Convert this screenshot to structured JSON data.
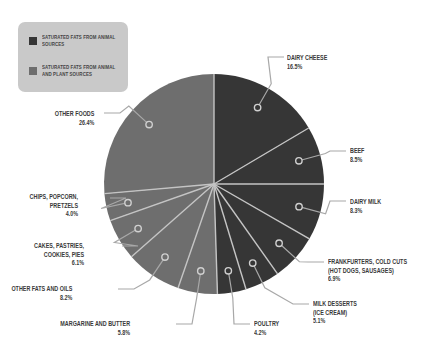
{
  "legend": {
    "items": [
      {
        "label": "SATURATED FATS FROM ANIMAL SOURCES",
        "color": "#363636"
      },
      {
        "label": "SATURATED FATS FROM ANIMAL AND PLANT SOURCES",
        "color": "#6e6e6e"
      }
    ]
  },
  "labels": {
    "dairy_cheese": {
      "name": "DAIRY CHEESE",
      "value": "16.5%"
    },
    "beef": {
      "name": "BEEF",
      "value": "8.5%"
    },
    "dairy_milk": {
      "name": "DAIRY MILK",
      "value": "8.3%"
    },
    "frankfurters_l1": "FRANKFURTERS, COLD CUTS",
    "frankfurters_l2": "(HOT DOGS, SAUSAGES)",
    "frankfurters_value": "6.9%",
    "milk_desserts_l1": "MILK DESSERTS",
    "milk_desserts_l2": "(ICE CREAM)",
    "milk_desserts_value": "5.1%",
    "poultry": {
      "name": "POULTRY",
      "value": "4.2%"
    },
    "margarine": {
      "name": "MARGARINE AND BUTTER",
      "value": "5.8%"
    },
    "other_fats": {
      "name": "OTHER FATS AND OILS",
      "value": "8.2%"
    },
    "cakes_l1": "CAKES, PASTRIES,",
    "cakes_l2": "COOKIES, PIES",
    "cakes_value": "6.1%",
    "chips_l1": "CHIPS, POPCORN,",
    "chips_l2": "PRETZELS",
    "chips_value": "4.0%",
    "other_foods": {
      "name": "OTHER FOODS",
      "value": "26.4%"
    }
  },
  "colors": {
    "animal": "#363636",
    "animal_and_plant": "#6e6e6e",
    "separator": "#c4c4c4",
    "leader": "#a8a8a8",
    "legend_bg": "#c9c9c9"
  },
  "chart_data": {
    "type": "pie",
    "title": "",
    "categories": [
      "Dairy cheese",
      "Beef",
      "Dairy milk",
      "Frankfurters, cold cuts (hot dogs, sausages)",
      "Milk desserts (ice cream)",
      "Poultry",
      "Margarine and butter",
      "Other fats and oils",
      "Cakes, pastries, cookies, pies",
      "Chips, popcorn, pretzels",
      "Other foods"
    ],
    "values": [
      16.5,
      8.5,
      8.3,
      6.9,
      5.1,
      4.2,
      5.8,
      8.2,
      6.1,
      4.0,
      26.4
    ],
    "groups": [
      "animal",
      "animal",
      "animal",
      "animal",
      "animal",
      "animal",
      "animal_and_plant",
      "animal_and_plant",
      "animal_and_plant",
      "animal_and_plant",
      "animal_and_plant"
    ],
    "legend": [
      "Saturated fats from animal sources",
      "Saturated fats from animal and plant sources"
    ],
    "legend_position": "top-left",
    "start_angle": "12 o'clock",
    "direction": "clockwise",
    "unit": "%"
  }
}
